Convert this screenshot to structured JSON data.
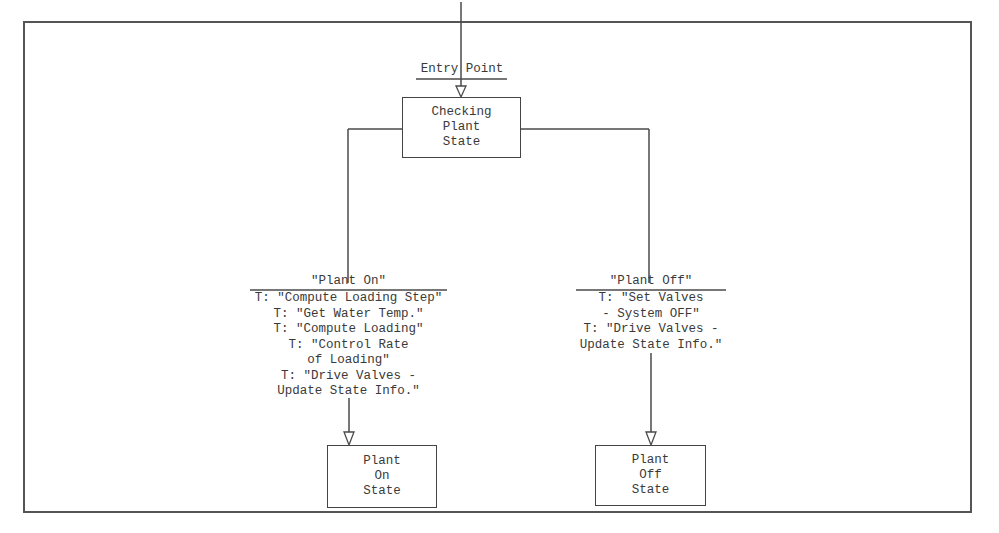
{
  "diagram": {
    "type": "state-transition",
    "entry": {
      "label": "Entry Point"
    },
    "states": [
      {
        "id": "checking",
        "lines": [
          "Checking",
          "Plant",
          "State"
        ]
      },
      {
        "id": "plant_on",
        "lines": [
          "Plant",
          "On",
          "State"
        ]
      },
      {
        "id": "plant_off",
        "lines": [
          "Plant",
          "Off",
          "State"
        ]
      }
    ],
    "transitions": [
      {
        "from": "checking",
        "to": "plant_on",
        "condition": "\"Plant On\"",
        "actions": [
          "T: \"Compute Loading Step\"",
          "T: \"Get Water Temp.\"",
          "T: \"Compute Loading\"",
          "T: \"Control Rate",
          "of Loading\"",
          "T: \"Drive Valves -",
          "Update State Info.\""
        ]
      },
      {
        "from": "checking",
        "to": "plant_off",
        "condition": "\"Plant Off\"",
        "actions": [
          "T: \"Set Valves",
          "- System OFF\"",
          "T: \"Drive Valves -",
          "Update State Info.\""
        ]
      }
    ]
  }
}
